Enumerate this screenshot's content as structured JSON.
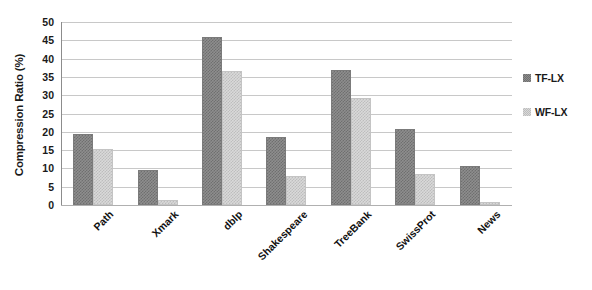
{
  "chart_data": {
    "type": "bar",
    "title": "",
    "xlabel": "",
    "ylabel": "Compression Ratio (%)",
    "ylim": [
      0,
      50
    ],
    "ytick_step": 5,
    "yticks": [
      50,
      45,
      40,
      35,
      30,
      25,
      20,
      15,
      10,
      5,
      0
    ],
    "grid": true,
    "legend_position": "right",
    "categories": [
      "Path",
      "Xmark",
      "dblp",
      "Shakespeare",
      "TreeBank",
      "SwissProt",
      "News"
    ],
    "series": [
      {
        "name": "TF-LX",
        "color": "#8e8e8e",
        "values": [
          19.5,
          9.5,
          46.0,
          18.5,
          36.8,
          20.7,
          10.7
        ]
      },
      {
        "name": "WF-LX",
        "color": "#d9d9d9",
        "values": [
          15.3,
          1.5,
          36.5,
          8.0,
          29.3,
          8.5,
          0.7
        ]
      }
    ]
  },
  "legend": {
    "entries": [
      {
        "label": "TF-LX",
        "swatch": "tf"
      },
      {
        "label": "WF-LX",
        "swatch": "wf"
      }
    ]
  }
}
